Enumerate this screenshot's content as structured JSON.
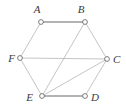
{
  "figure": {
    "type": "undirected-graph-diagram",
    "width": 126,
    "height": 111,
    "background_color": "#ffffff",
    "node_fill_color": "#ffffff",
    "node_stroke_color": "#6e6e6e",
    "node_radius": 2.4,
    "edge_color_thin": "#b5b5b5",
    "edge_color_thick": "#9a9a9a",
    "label_color": "#3a3a3a"
  },
  "chart_data": {
    "type": "diagram",
    "title": "",
    "nodes": [
      {
        "id": "A",
        "label": "A",
        "x": 41,
        "y": 22,
        "label_x": 37,
        "label_y": 13,
        "label_anchor": "middle"
      },
      {
        "id": "B",
        "label": "B",
        "x": 85,
        "y": 22,
        "label_x": 81,
        "label_y": 13,
        "label_anchor": "middle"
      },
      {
        "id": "C",
        "label": "C",
        "x": 107,
        "y": 59,
        "label_x": 113,
        "label_y": 63,
        "label_anchor": "start"
      },
      {
        "id": "D",
        "label": "D",
        "x": 85,
        "y": 96,
        "label_x": 91,
        "label_y": 101,
        "label_anchor": "start"
      },
      {
        "id": "E",
        "label": "E",
        "x": 42,
        "y": 96,
        "label_x": 33,
        "label_y": 101,
        "label_anchor": "end"
      },
      {
        "id": "F",
        "label": "F",
        "x": 20,
        "y": 58,
        "label_x": 15,
        "label_y": 62,
        "label_anchor": "end"
      }
    ],
    "edges": [
      {
        "from": "A",
        "to": "B",
        "weight": "thick"
      },
      {
        "from": "A",
        "to": "F",
        "weight": "thin"
      },
      {
        "from": "B",
        "to": "C",
        "weight": "thin"
      },
      {
        "from": "B",
        "to": "E",
        "weight": "thin"
      },
      {
        "from": "F",
        "to": "C",
        "weight": "thin"
      },
      {
        "from": "F",
        "to": "E",
        "weight": "thin"
      },
      {
        "from": "E",
        "to": "C",
        "weight": "thin"
      },
      {
        "from": "E",
        "to": "D",
        "weight": "thick"
      },
      {
        "from": "D",
        "to": "C",
        "weight": "thin"
      }
    ]
  }
}
